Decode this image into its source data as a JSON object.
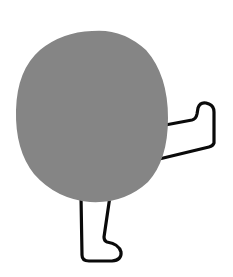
{
  "illustration": {
    "subject": "gray round body with two legs, one kicking",
    "background_color": "#ffffff",
    "body_color": "#858585",
    "line_color": "#0a0a0a"
  }
}
